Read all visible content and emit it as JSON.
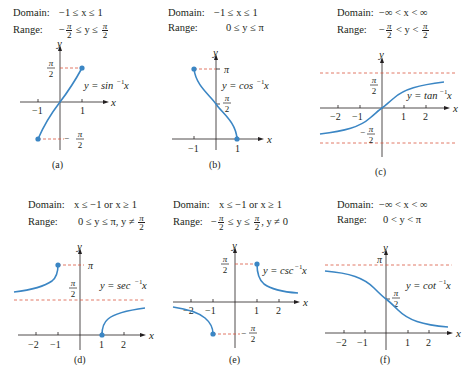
{
  "figure": {
    "colors": {
      "curve": "#3b86c4",
      "asymptote": "#d9563f",
      "axis": "#231f20",
      "text": "#231f20"
    },
    "panels": [
      {
        "id": "a",
        "caption": "(a)",
        "domain_label": "Domain:",
        "domain_text": "−1 ≤ x ≤ 1",
        "range_label": "Range:",
        "range_text": "−π/2 ≤ y ≤ π/2",
        "range_parts": [
          "−",
          "π",
          "2",
          "≤ y ≤",
          "π",
          "2"
        ],
        "function_label": "y = sin",
        "function_sup": "−1",
        "function_var": "x",
        "x_ticks": [
          "−1",
          "1"
        ],
        "y_ticks": [
          "π/2",
          "−π/2"
        ]
      },
      {
        "id": "b",
        "caption": "(b)",
        "domain_label": "Domain:",
        "domain_text": "−1 ≤ x ≤ 1",
        "range_label": "Range:",
        "range_text": "0 ≤ y ≤ π",
        "function_label": "y = cos",
        "function_sup": "−1",
        "function_var": "x",
        "x_ticks": [
          "−1",
          "1"
        ],
        "y_ticks": [
          "π",
          "π/2"
        ]
      },
      {
        "id": "c",
        "caption": "(c)",
        "domain_label": "Domain:",
        "domain_text": "−∞ < x < ∞",
        "range_label": "Range:",
        "range_text": "−π/2 < y < π/2",
        "range_parts": [
          "−",
          "π",
          "2",
          "< y <",
          "π",
          "2"
        ],
        "function_label": "y = tan",
        "function_sup": "−1",
        "function_var": "x",
        "x_ticks": [
          "−2",
          "−1",
          "1",
          "2"
        ],
        "y_ticks": [
          "π/2",
          "−π/2"
        ]
      },
      {
        "id": "d",
        "caption": "(d)",
        "domain_label": "Domain:",
        "domain_text": "x ≤ −1 or x ≥ 1",
        "range_label": "Range:",
        "range_text": "0 ≤ y ≤ π, y ≠ π/2",
        "range_parts": [
          "0 ≤ y ≤ π, y ≠",
          "π",
          "2"
        ],
        "function_label": "y = sec",
        "function_sup": "−1",
        "function_var": "x",
        "x_ticks": [
          "−2",
          "−1",
          "1",
          "2"
        ],
        "y_ticks": [
          "π",
          "π/2"
        ]
      },
      {
        "id": "e",
        "caption": "(e)",
        "domain_label": "Domain:",
        "domain_text": "x ≤ −1 or x ≥ 1",
        "range_label": "Range:",
        "range_text": "−π/2 ≤ y ≤ π/2, y ≠ 0",
        "range_parts": [
          "−",
          "π",
          "2",
          "≤ y ≤",
          "π",
          "2",
          ", y ≠ 0"
        ],
        "function_label": "y = csc",
        "function_sup": "−1",
        "function_var": "x",
        "x_ticks": [
          "−2",
          "−1",
          "1",
          "2"
        ],
        "y_ticks": [
          "π/2",
          "−π/2"
        ]
      },
      {
        "id": "f",
        "caption": "(f)",
        "domain_label": "Domain:",
        "domain_text": "−∞ < x < ∞",
        "range_label": "Range:",
        "range_text": "0 < y < π",
        "function_label": "y = cot",
        "function_sup": "−1",
        "function_var": "x",
        "x_ticks": [
          "−2",
          "−1",
          "1",
          "2"
        ],
        "y_ticks": [
          "π",
          "π/2"
        ]
      }
    ],
    "axis_labels": {
      "x": "x",
      "y": "y"
    },
    "symbols": {
      "pi": "π",
      "two": "2"
    }
  }
}
